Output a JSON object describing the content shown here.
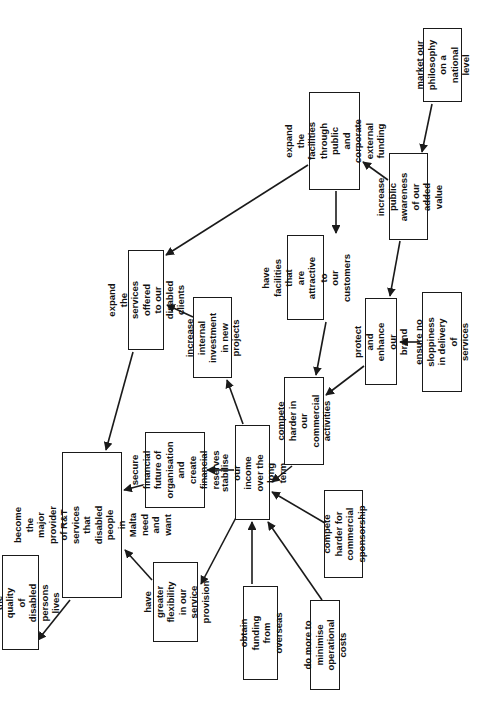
{
  "diagram": {
    "type": "cognitive-map",
    "orientation": "rotated-90-ccw",
    "colors": {
      "box_border": "#1a1a1a",
      "text": "#111111",
      "arrow": "#1a1a1a",
      "background": "#ffffff"
    },
    "nodes": [
      {
        "id": "improve-quality",
        "label": "improve the quality\nof disabled persons\nlives",
        "box": [
          2,
          555,
          37,
          95
        ]
      },
      {
        "id": "major-provider",
        "label": "become the major\nprovider of R&T\nservices that\ndisabled people in\nMalta need and want",
        "box": [
          62,
          452,
          60,
          146
        ]
      },
      {
        "id": "expand-services",
        "label": "expand the services\noffered to our\ndisabled clients",
        "box": [
          128,
          250,
          36,
          100
        ]
      },
      {
        "id": "secure-financial",
        "label": "secure financial\nfuture of\norganisation and\ncreate financial\nreserves",
        "box": [
          145,
          432,
          60,
          76
        ]
      },
      {
        "id": "greater-flexibility",
        "label": "have greater\nflexibility in our\nservice provision",
        "box": [
          153,
          562,
          45,
          80
        ]
      },
      {
        "id": "internal-investment",
        "label": "increase internal\ninvestment in new\nprojects",
        "box": [
          193,
          297,
          39,
          81
        ]
      },
      {
        "id": "stabilise-income",
        "label": "stabilise our income\nover the long term",
        "box": [
          235,
          425,
          35,
          95
        ]
      },
      {
        "id": "funding-overseas",
        "label": "obtain funding from\noverseas",
        "box": [
          243,
          586,
          35,
          94
        ]
      },
      {
        "id": "minimise-costs",
        "label": "do more to minimise\noperational costs",
        "box": [
          310,
          600,
          30,
          90
        ]
      },
      {
        "id": "compete-commercial",
        "label": "compete harder in\nour commercial\nactivities",
        "box": [
          284,
          377,
          40,
          88
        ]
      },
      {
        "id": "attractive-facilities",
        "label": "have facilities that\nare attractive to\nour customers",
        "box": [
          287,
          235,
          37,
          85
        ]
      },
      {
        "id": "compete-sponsorship",
        "label": "compete harder for\ncommercial\nsponsorship",
        "box": [
          324,
          490,
          39,
          88
        ]
      },
      {
        "id": "protect-brand",
        "label": "protect and enhance\nour brand",
        "box": [
          365,
          298,
          32,
          87
        ]
      },
      {
        "id": "no-sloppiness",
        "label": "ensure no sloppiness\nin delivery of\nservices",
        "box": [
          422,
          292,
          40,
          100
        ]
      },
      {
        "id": "expand-facilities",
        "label": "expand the\nfacilities through\npublic and corporate\nexternal funding",
        "box": [
          309,
          92,
          51,
          98
        ]
      },
      {
        "id": "public-awareness",
        "label": "increase public\nawareness of our\nadded value",
        "box": [
          389,
          153,
          39,
          87
        ]
      },
      {
        "id": "market-philosophy",
        "label": "market our\nphilosophy on a\nnational level",
        "box": [
          423,
          28,
          39,
          74
        ]
      }
    ],
    "edges": [
      {
        "from": "market-philosophy",
        "to": "public-awareness",
        "line": [
          432,
          104,
          422,
          152
        ]
      },
      {
        "from": "public-awareness",
        "to": "expand-facilities",
        "line": [
          388,
          180,
          363,
          162
        ]
      },
      {
        "from": "public-awareness",
        "to": "protect-brand",
        "line": [
          400,
          241,
          390,
          296
        ]
      },
      {
        "from": "expand-facilities",
        "to": "attractive-facilities",
        "line": [
          336,
          191,
          336,
          233
        ]
      },
      {
        "from": "expand-facilities",
        "to": "expand-services",
        "line": [
          308,
          165,
          166,
          255
        ]
      },
      {
        "from": "attractive-facilities",
        "to": "compete-commercial",
        "line": [
          326,
          322,
          316,
          375
        ]
      },
      {
        "from": "no-sloppiness",
        "to": "protect-brand",
        "line": [
          420,
          342,
          400,
          342
        ]
      },
      {
        "from": "protect-brand",
        "to": "compete-commercial",
        "line": [
          364,
          366,
          326,
          395
        ]
      },
      {
        "from": "compete-commercial",
        "to": "stabilise-income",
        "line": [
          292,
          466,
          272,
          482
        ]
      },
      {
        "from": "compete-sponsorship",
        "to": "stabilise-income",
        "line": [
          330,
          526,
          272,
          492
        ]
      },
      {
        "from": "minimise-costs",
        "to": "stabilise-income",
        "line": [
          322,
          600,
          268,
          522
        ]
      },
      {
        "from": "funding-overseas",
        "to": "stabilise-income",
        "line": [
          252,
          584,
          252,
          522
        ]
      },
      {
        "from": "stabilise-income",
        "to": "internal-investment",
        "line": [
          243,
          424,
          227,
          380
        ]
      },
      {
        "from": "stabilise-income",
        "to": "secure-financial",
        "line": [
          234,
          470,
          207,
          470
        ]
      },
      {
        "from": "stabilise-income",
        "to": "greater-flexibility",
        "line": [
          240,
          510,
          201,
          584
        ]
      },
      {
        "from": "internal-investment",
        "to": "expand-services",
        "line": [
          193,
          317,
          167,
          305
        ]
      },
      {
        "from": "expand-services",
        "to": "major-provider",
        "line": [
          133,
          352,
          106,
          450
        ]
      },
      {
        "from": "secure-financial",
        "to": "major-provider",
        "line": [
          143,
          485,
          124,
          490
        ]
      },
      {
        "from": "greater-flexibility",
        "to": "major-provider",
        "line": [
          152,
          580,
          125,
          550
        ]
      },
      {
        "from": "major-provider",
        "to": "improve-quality",
        "line": [
          70,
          600,
          38,
          640
        ]
      }
    ]
  }
}
